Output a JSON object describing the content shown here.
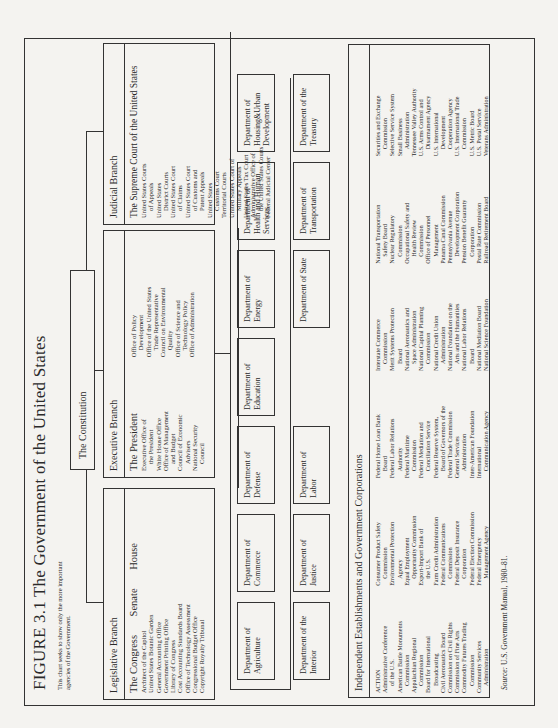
{
  "figure": {
    "title": "FIGURE 3.1 The Government of the United States",
    "note": "This chart seeks to show only the more important agencies of the Government.",
    "source_label": "Source:",
    "source_text": "U.S. Government Manual, 1980–81."
  },
  "constitution": "The Constitution",
  "legislative": {
    "heading": "Legislative Branch",
    "congress": "The Congress",
    "senate": "Senate",
    "house": "House",
    "items": [
      "Architect of the Capitol",
      "United States Botanic Garden",
      "General Accounting Office",
      "Government Printing Office",
      "Library of Congress",
      "Cost Accounting Standards Board",
      "Office of Technology Assessment",
      "Congressional Budget Office",
      "Copyright Royalty Tribunal"
    ]
  },
  "executive": {
    "heading": "Executive Branch",
    "president": "The President",
    "col1": [
      "Executive Office of",
      "  the President",
      "White House Office",
      "Office of Management",
      "  and Budget",
      "Council of Economic",
      "  Advisers",
      "National Security",
      "  Council"
    ],
    "col2": [
      "Office of Policy",
      "  Development",
      "Office of the United States",
      "  Trade Representative",
      "Council on Environmental",
      "  Quality",
      "Office of Science and",
      "  Technology Policy",
      "Office of Administration"
    ]
  },
  "judicial": {
    "heading": "Judicial Branch",
    "supreme": "The Supreme Court of the United States",
    "col1": [
      "United States Courts",
      "  of Appeals",
      "United States",
      "  District Courts",
      "United States Court",
      "  of Claims",
      "United States Court",
      "  of Customs and",
      "  Patent Appeals"
    ],
    "col2": [
      "United States",
      "  Customs Court",
      "Territorial Courts",
      "United States Court of",
      "  Military Appeals",
      "United States Tax Court",
      "Administrative Office of",
      "  the United States Courts",
      "Federal Judicial Center"
    ]
  },
  "departments": {
    "row1": [
      "Department of Agriculture",
      "Department of Commerce",
      "Department of Defense",
      "Department of Education",
      "Department of Energy",
      "Department of Health and Human Services",
      "Department of Housing&Urban Development"
    ],
    "row2": [
      "Department of the Interior",
      "Department of Justice",
      "Department of Labor",
      "Department of State",
      "Department of Transportation",
      "Department of the Treasury"
    ]
  },
  "independent": {
    "heading": "Independent Establishments and Government Corporations",
    "columns": [
      [
        "ACTION",
        "Administrative Conference",
        "  of the U.S.",
        "American Battle Monuments",
        "  Commission",
        "Appalachian Regional",
        "  Commission",
        "Board for International",
        "  Broadcasting",
        "Civil Aeronautics Board",
        "Commission on Civil Rights",
        "Commission of Fine Arts",
        "Commodity Futures Trading",
        "  Commission",
        "Community Services",
        "  Administration"
      ],
      [
        "Consumer Product Safety",
        "  Commission",
        "Environmental Protection",
        "  Agency",
        "Equal Employment",
        "  Opportunity Commission",
        "Export-Import Bank of",
        "  the U.S.",
        "Farm Credit Administration",
        "Federal Communications",
        "  Commission",
        "Federal Deposit Insurance",
        "  Corporation",
        "Federal Election Commission",
        "Federal Emergency",
        "  Management Agency"
      ],
      [
        "Federal Home Loan Bank",
        "  Board",
        "Federal Labor Relations",
        "  Authority",
        "Federal Maritime",
        "  Commission",
        "Federal Mediation and",
        "  Conciliation Service",
        "Federal Reserve System,",
        "  Board of Governors of the",
        "Federal Trade Commission",
        "General Services",
        "  Administration",
        "Inter-American Foundation",
        "International",
        "  Communication Agency"
      ],
      [
        "Interstate Commerce",
        "  Commission",
        "Merit Systems Protection",
        "  Board",
        "National Aeronautics and",
        "  Space Administration",
        "National Capital Planning",
        "  Commission",
        "National Credit Union",
        "  Administration",
        "National Foundation on the",
        "  Arts and the Humanities",
        "National Labor Relations",
        "  Board",
        "National Mediation Board",
        "National Science Foundation"
      ],
      [
        "National Transportation",
        "  Safety Board",
        "Nuclear Regulatory",
        "  Commission",
        "Occupational Safety and",
        "  Health Review",
        "  Commission",
        "Office of Personnel",
        "  Management",
        "Panama Canal Commission",
        "Pennsylvania Avenue",
        "  Development Corporation",
        "Pension Benefit Guaranty",
        "  Corporation",
        "Postal Rate Commission",
        "Railroad Retirement Board"
      ],
      [
        "Securities and Exchange",
        "  Commission",
        "Selective Service System",
        "Small Business",
        "  Administration",
        "Tennessee Valley Authority",
        "U.S. Arms Control and",
        "  Disarmament Agency",
        "U.S. International",
        "  Development",
        "  Cooperation Agency",
        "U.S. International Trade",
        "  Commission",
        "U.S. Metric Board",
        "U.S. Postal Service",
        "Veterans Administration"
      ]
    ]
  }
}
